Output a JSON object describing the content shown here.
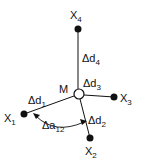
{
  "diagram": {
    "center": {
      "label": "M"
    },
    "nodes": [
      {
        "id": "x1",
        "base": "X",
        "sub": "1"
      },
      {
        "id": "x2",
        "base": "X",
        "sub": "2"
      },
      {
        "id": "x3",
        "base": "X",
        "sub": "3"
      },
      {
        "id": "x4",
        "base": "X",
        "sub": "4"
      }
    ],
    "edges": [
      {
        "id": "d1",
        "base": "Δd",
        "sub": "1"
      },
      {
        "id": "d2",
        "base": "Δd",
        "sub": "2"
      },
      {
        "id": "d3",
        "base": "Δd",
        "sub": "3"
      },
      {
        "id": "d4",
        "base": "Δd",
        "sub": "4"
      }
    ],
    "angle": {
      "base": "Δa",
      "sub": "12"
    },
    "colors": {
      "ink": "#111111",
      "background": "#ffffff"
    }
  }
}
